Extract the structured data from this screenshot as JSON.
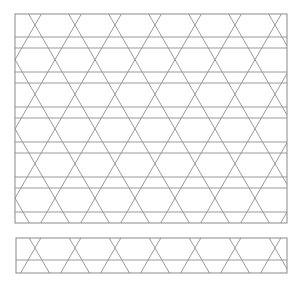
{
  "figure": {
    "background": "#ffffff",
    "line_color": "#8f8f8f",
    "canvas": {
      "width": 301,
      "height": 284
    }
  },
  "panels": [
    {
      "name": "main-pattern-panel",
      "x": 15,
      "y": 14,
      "width": 272,
      "height": 209,
      "diag_period_x": 40,
      "down_right_offset": 20.57,
      "up_right_offset": 9.43,
      "horizontal_lines": [
        37,
        48,
        72,
        83,
        107,
        118,
        142,
        153,
        177,
        188,
        212
      ]
    },
    {
      "name": "strip-pattern-panel",
      "x": 16,
      "y": 238,
      "width": 271,
      "height": 35,
      "diag_period_x": 40,
      "down_right_offset": 11.8,
      "up_right_offset": 18.2,
      "horizontal_lines": [
        260
      ]
    }
  ]
}
